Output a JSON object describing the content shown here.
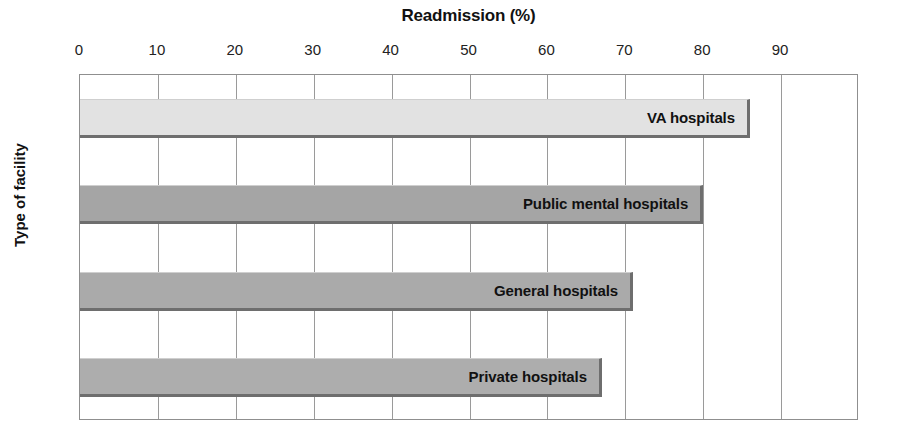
{
  "chart_data": {
    "type": "bar",
    "orientation": "horizontal",
    "title": "Readmission (%)",
    "xlabel": "Readmission (%)",
    "ylabel": "Type of facility",
    "categories": [
      "VA hospitals",
      "Public mental hospitals",
      "General hospitals",
      "Private hospitals"
    ],
    "values": [
      86,
      80,
      71,
      67
    ],
    "xlim": [
      0,
      100
    ],
    "xticks": [
      0,
      10,
      20,
      30,
      40,
      50,
      60,
      70,
      80,
      90
    ],
    "xtick_labels": [
      "0",
      "10",
      "20",
      "30",
      "40",
      "50",
      "60",
      "70",
      "80",
      "90"
    ],
    "grid": "vertical",
    "legend": "none",
    "bar_colors": [
      "#e2e2e2",
      "#a5a5a5",
      "#aaaaaa",
      "#adadad"
    ],
    "bar_edge_color": "#6e6e6e",
    "frame_color": "#8f8f8f",
    "gridline_color": "#9a9a9a",
    "series": [
      {
        "name": "Readmission (%)",
        "points": [
          {
            "category": "VA hospitals",
            "value": 86
          },
          {
            "category": "Public mental hospitals",
            "value": 80
          },
          {
            "category": "General hospitals",
            "value": 71
          },
          {
            "category": "Private hospitals",
            "value": 67
          }
        ]
      }
    ]
  }
}
